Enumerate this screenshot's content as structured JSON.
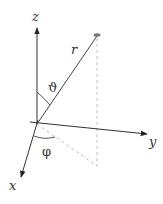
{
  "diagram": {
    "axes": {
      "x_label": "x",
      "y_label": "y",
      "z_label": "z"
    },
    "vector_label": "r",
    "polar_angle_label": "ϑ",
    "azimuth_angle_label": "φ",
    "colors": {
      "axis": "#333333",
      "dashed": "#aaaaaa",
      "point": "#777777",
      "background": "#ffffff"
    }
  }
}
